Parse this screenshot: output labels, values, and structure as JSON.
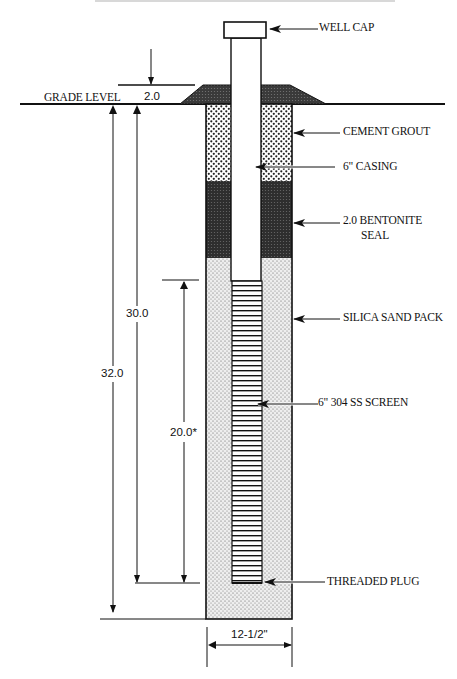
{
  "diagram": {
    "title_partial": "",
    "labels": {
      "well_cap": "WELL CAP",
      "grade_level": "GRADE LEVEL",
      "cement_grout": "CEMENT GROUT",
      "casing": "6\" CASING",
      "bentonite_line1": "2.0 BENTONITE",
      "bentonite_line2": "SEAL",
      "sand_pack": "SILICA SAND PACK",
      "screen": "6\" 304 SS SCREEN",
      "threaded_plug": "THREADED PLUG"
    },
    "dimensions": {
      "stickup": "2.0",
      "casing_depth": "30.0",
      "total_depth": "32.0",
      "screen_length": "20.0*",
      "borehole_diameter": "12-1/2\""
    },
    "colors": {
      "line": "#111111",
      "bentonite": "#3a3a3a",
      "mound": "#404040",
      "grout_bg": "#ffffff",
      "sand_bg": "#e9e9e9"
    }
  }
}
